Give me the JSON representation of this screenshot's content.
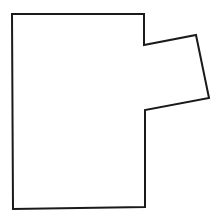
{
  "diagram": {
    "type": "polygon-outline",
    "stroke_color": "#1a1a1a",
    "fill_color": "#ffffff",
    "background": "#ffffff",
    "stroke_width": 2,
    "points": "12,14 144,14 144,45 196,35 209,98 145,110 145,207 13,209"
  }
}
